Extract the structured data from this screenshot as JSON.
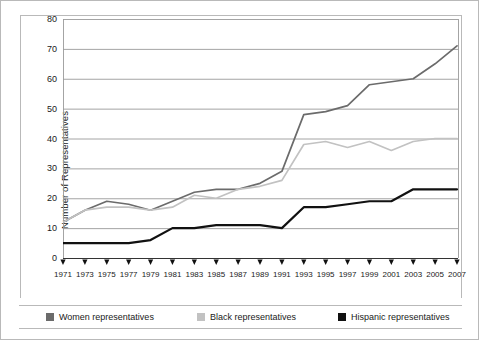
{
  "chart_data": {
    "type": "line",
    "title": "",
    "xlabel": "",
    "ylabel": "Number of Representatives",
    "ylim": [
      0,
      80
    ],
    "ytick_step": 10,
    "yticks": [
      80,
      70,
      60,
      50,
      40,
      30,
      20,
      10,
      0
    ],
    "grid": "horizontal",
    "legend_position": "bottom",
    "categories": [
      "1971",
      "1973",
      "1975",
      "1977",
      "1979",
      "1981",
      "1983",
      "1985",
      "1987",
      "1989",
      "1991",
      "1993",
      "1995",
      "1997",
      "1999",
      "2001",
      "2003",
      "2005",
      "2007"
    ],
    "series": [
      {
        "name": "Women representatives",
        "color": "#6b6b6b",
        "values": [
          12,
          16,
          19,
          18,
          16,
          19,
          22,
          23,
          23,
          25,
          29,
          48,
          49,
          51,
          58,
          59,
          60,
          65,
          71
        ]
      },
      {
        "name": "Black representatives",
        "color": "#c2c2c2",
        "values": [
          12,
          16,
          17,
          17,
          16,
          17,
          21,
          20,
          23,
          24,
          26,
          38,
          39,
          37,
          39,
          36,
          39,
          40,
          40
        ]
      },
      {
        "name": "Hispanic representatives",
        "color": "#111111",
        "values": [
          5,
          5,
          5,
          5,
          6,
          10,
          10,
          11,
          11,
          11,
          10,
          17,
          17,
          18,
          19,
          19,
          23,
          23,
          23
        ]
      }
    ]
  },
  "legend": {
    "items": [
      {
        "label": "Women representatives",
        "swatch": "#6b6b6b",
        "icon": "legend-swatch-icon"
      },
      {
        "label": "Black representatives",
        "swatch": "#c2c2c2",
        "icon": "legend-swatch-icon"
      },
      {
        "label": "Hispanic representatives",
        "swatch": "#111111",
        "icon": "legend-swatch-icon"
      }
    ]
  },
  "axes": {
    "y_title": "Number of Representatives",
    "tick_marker_icon": "triangle-tick-icon"
  }
}
